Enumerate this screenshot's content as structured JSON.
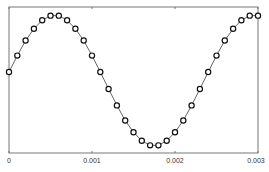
{
  "chart_data": {
    "type": "line",
    "title": "",
    "xlabel": "",
    "ylabel": "",
    "xlim": [
      0,
      0.003
    ],
    "ylim": [
      -1.1,
      1.1
    ],
    "grid": false,
    "legend": null,
    "x_ticks": [
      "0",
      "0.001",
      "0.002",
      "0.003"
    ],
    "x_tick_values": [
      0,
      0.001,
      0.002,
      0.003
    ],
    "marker": "open-circle",
    "line_color": "#555555",
    "marker_edge_color": "#111111",
    "series": [
      {
        "name": "signal",
        "x": [
          0,
          0.0001,
          0.0002,
          0.0003,
          0.0004,
          0.0005,
          0.0006,
          0.0007,
          0.0008,
          0.0009,
          0.001,
          0.0011,
          0.0012,
          0.0013,
          0.0014,
          0.0015,
          0.0016,
          0.0017,
          0.0018,
          0.0019,
          0.002,
          0.0021,
          0.0022,
          0.0023,
          0.0024,
          0.0025,
          0.0026,
          0.0027,
          0.0028,
          0.0029,
          0.003
        ],
        "values": [
          0.13,
          0.38,
          0.61,
          0.79,
          0.92,
          0.99,
          0.99,
          0.92,
          0.79,
          0.61,
          0.38,
          0.13,
          -0.13,
          -0.38,
          -0.61,
          -0.79,
          -0.92,
          -0.99,
          -0.99,
          -0.92,
          -0.79,
          -0.61,
          -0.38,
          -0.13,
          0.13,
          0.38,
          0.61,
          0.79,
          0.92,
          0.99,
          0.99
        ]
      }
    ]
  }
}
